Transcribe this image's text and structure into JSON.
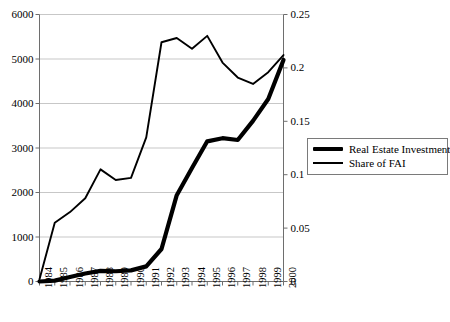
{
  "chart_data": {
    "type": "line",
    "title": "",
    "subtitle": "",
    "xlabel": "",
    "ylabel": "",
    "y2label": "",
    "grid": true,
    "legend_position": "right",
    "categories": [
      "1984",
      "1985",
      "1986",
      "1987",
      "1988",
      "1989",
      "1990",
      "1991",
      "1992",
      "1993",
      "1994",
      "1995",
      "1996",
      "1997",
      "1998",
      "1999",
      "2000"
    ],
    "ylim": [
      0,
      6000
    ],
    "yticks": [
      "0",
      "1000",
      "2000",
      "3000",
      "4000",
      "5000",
      "6000"
    ],
    "ytick_values": [
      0,
      1000,
      2000,
      3000,
      4000,
      5000,
      6000
    ],
    "y2lim": [
      0,
      0.25
    ],
    "y2ticks": [
      "0",
      "0.05",
      "0.1",
      "0.15",
      "0.2",
      "0.25"
    ],
    "y2tick_values": [
      0,
      0.05,
      0.1,
      0.15,
      0.2,
      0.25
    ],
    "series": [
      {
        "name": "Real Estate Investment",
        "axis": "left",
        "style": "thick",
        "color": "#000000",
        "values": [
          0,
          20,
          100,
          180,
          240,
          230,
          250,
          340,
          730,
          1940,
          2550,
          3150,
          3220,
          3180,
          3610,
          4100,
          4980
        ]
      },
      {
        "name": "Share of FAI",
        "axis": "right",
        "style": "thin",
        "color": "#000000",
        "values": [
          0.002,
          0.055,
          0.065,
          0.078,
          0.105,
          0.095,
          0.097,
          0.135,
          0.224,
          0.228,
          0.218,
          0.23,
          0.205,
          0.191,
          0.185,
          0.196,
          0.212
        ]
      }
    ]
  },
  "legend": {
    "entries": [
      {
        "label": "Real Estate Investment",
        "swatch": "thick-line-swatch"
      },
      {
        "label": "Share of FAI",
        "swatch": "thin-line-swatch"
      }
    ]
  }
}
